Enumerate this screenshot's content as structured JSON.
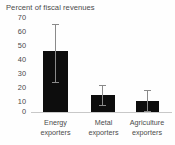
{
  "chart_data": {
    "type": "bar",
    "title": "Percent of fiscal revenues",
    "xlabel": "",
    "ylabel": "",
    "ylim": [
      0,
      70
    ],
    "yticks": [
      0,
      10,
      20,
      30,
      40,
      50,
      60,
      70
    ],
    "ytick_labels": [
      "0",
      "10",
      "20",
      "30",
      "40",
      "50",
      "60",
      "70"
    ],
    "grid": false,
    "legend": null,
    "categories": [
      "Energy exporters",
      "Metal exporters",
      "Agriculture exporters"
    ],
    "category_lines": [
      [
        "Energy",
        "exporters"
      ],
      [
        "Metal",
        "exporters"
      ],
      [
        "Agriculture",
        "exporters"
      ]
    ],
    "values": [
      45,
      12.5,
      8
    ],
    "error_low": [
      22,
      5,
      1
    ],
    "error_high": [
      65,
      20,
      16
    ],
    "colors": {
      "bar": "#0d0d0d",
      "error_bar": "#8a8a8a",
      "axis": "#c8c8c8",
      "text": "#4a4a4a",
      "background": "#fefefe"
    }
  }
}
